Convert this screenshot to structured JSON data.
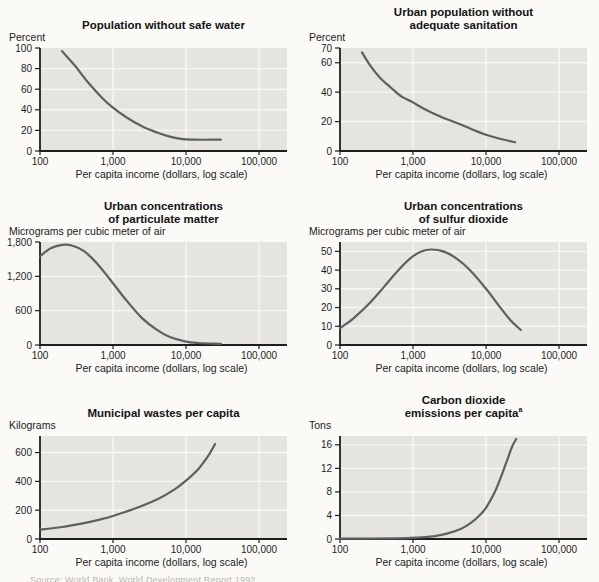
{
  "figure": {
    "x_axis_label": "Per capita income (dollars, log scale)",
    "x_ticks": [
      {
        "value": 100,
        "label": "100"
      },
      {
        "value": 1000,
        "label": "1,000"
      },
      {
        "value": 10000,
        "label": "10,000"
      },
      {
        "value": 100000,
        "label": "100,000"
      }
    ],
    "x_gridlines": [
      1000,
      10000,
      100000
    ],
    "source_note": "Source: World Bank, World Development Report 1992.",
    "colors": {
      "page_bg": "#fbfaf7",
      "plot_bg": "#e5e4e1",
      "grid": "#f7f6f3",
      "curve": "#5f5f5f",
      "axis": "#1e1e1e",
      "text": "#1e1e1e"
    }
  },
  "chart_data": [
    {
      "type": "line",
      "title_line1": "Population without safe water",
      "unit_label": "Percent",
      "xlabel": "Per capita income (dollars, log scale)",
      "x_scale": "log",
      "xlim": [
        100,
        100000
      ],
      "ylim": [
        0,
        100
      ],
      "y_ticks": [
        {
          "value": 0,
          "label": "0"
        },
        {
          "value": 20,
          "label": "20"
        },
        {
          "value": 40,
          "label": "40"
        },
        {
          "value": 60,
          "label": "60"
        },
        {
          "value": 80,
          "label": "80"
        },
        {
          "value": 100,
          "label": "100"
        }
      ],
      "points": [
        [
          200,
          97
        ],
        [
          300,
          83
        ],
        [
          450,
          67
        ],
        [
          700,
          52
        ],
        [
          1000,
          42
        ],
        [
          1500,
          33
        ],
        [
          2500,
          24
        ],
        [
          4000,
          18
        ],
        [
          6000,
          14
        ],
        [
          9000,
          11.5
        ],
        [
          13000,
          11
        ],
        [
          30000,
          11
        ]
      ]
    },
    {
      "type": "line",
      "title_line1": "Urban population without",
      "title_line2": "adequate sanitation",
      "unit_label": "Percent",
      "xlabel": "Per capita income (dollars, log scale)",
      "x_scale": "log",
      "xlim": [
        100,
        100000
      ],
      "ylim": [
        0,
        70
      ],
      "y_ticks": [
        {
          "value": 0,
          "label": "0"
        },
        {
          "value": 20,
          "label": "20"
        },
        {
          "value": 40,
          "label": "40"
        },
        {
          "value": 60,
          "label": "60"
        },
        {
          "value": 70,
          "label": "70"
        }
      ],
      "points": [
        [
          200,
          67
        ],
        [
          260,
          58
        ],
        [
          350,
          50
        ],
        [
          500,
          43
        ],
        [
          700,
          37
        ],
        [
          1000,
          33
        ],
        [
          1500,
          28
        ],
        [
          2500,
          23
        ],
        [
          4000,
          19
        ],
        [
          7000,
          14
        ],
        [
          10000,
          11
        ],
        [
          15000,
          8.5
        ],
        [
          25000,
          6
        ]
      ]
    },
    {
      "type": "line",
      "title_line1": "Urban concentrations",
      "title_line2": "of particulate matter",
      "unit_label": "Micrograms per cubic meter of air",
      "xlabel": "Per capita income (dollars, log scale)",
      "x_scale": "log",
      "xlim": [
        100,
        100000
      ],
      "ylim": [
        0,
        1800
      ],
      "y_ticks": [
        {
          "value": 0,
          "label": "0"
        },
        {
          "value": 600,
          "label": "600"
        },
        {
          "value": 1200,
          "label": "1,200"
        },
        {
          "value": 1800,
          "label": "1,800"
        }
      ],
      "points": [
        [
          100,
          1550
        ],
        [
          140,
          1690
        ],
        [
          200,
          1750
        ],
        [
          280,
          1735
        ],
        [
          400,
          1640
        ],
        [
          600,
          1430
        ],
        [
          1000,
          1080
        ],
        [
          1500,
          790
        ],
        [
          2500,
          470
        ],
        [
          4000,
          265
        ],
        [
          6000,
          140
        ],
        [
          10000,
          60
        ],
        [
          15000,
          35
        ],
        [
          30000,
          20
        ]
      ]
    },
    {
      "type": "line",
      "title_line1": "Urban concentrations",
      "title_line2": "of sulfur dioxide",
      "unit_label": "Micrograms per cubic meter of air",
      "xlabel": "Per capita income (dollars, log scale)",
      "x_scale": "log",
      "xlim": [
        100,
        100000
      ],
      "ylim": [
        0,
        55
      ],
      "y_ticks": [
        {
          "value": 0,
          "label": "0"
        },
        {
          "value": 10,
          "label": "10"
        },
        {
          "value": 20,
          "label": "20"
        },
        {
          "value": 30,
          "label": "30"
        },
        {
          "value": 40,
          "label": "40"
        },
        {
          "value": 50,
          "label": "50"
        }
      ],
      "points": [
        [
          100,
          9
        ],
        [
          150,
          14
        ],
        [
          250,
          22
        ],
        [
          400,
          31
        ],
        [
          600,
          39
        ],
        [
          900,
          46
        ],
        [
          1300,
          50
        ],
        [
          1800,
          51
        ],
        [
          2600,
          50
        ],
        [
          4000,
          46
        ],
        [
          6000,
          40
        ],
        [
          10000,
          30
        ],
        [
          15000,
          21
        ],
        [
          22000,
          13
        ],
        [
          30000,
          8
        ]
      ]
    },
    {
      "type": "line",
      "title_line1": "Municipal wastes per capita",
      "unit_label": "Kilograms",
      "xlabel": "Per capita income (dollars, log scale)",
      "x_scale": "log",
      "xlim": [
        100,
        100000
      ],
      "ylim": [
        0,
        715
      ],
      "y_ticks": [
        {
          "value": 0,
          "label": "0"
        },
        {
          "value": 200,
          "label": "200"
        },
        {
          "value": 400,
          "label": "400"
        },
        {
          "value": 600,
          "label": "600"
        }
      ],
      "points": [
        [
          100,
          65
        ],
        [
          200,
          83
        ],
        [
          400,
          110
        ],
        [
          700,
          138
        ],
        [
          1000,
          160
        ],
        [
          2000,
          212
        ],
        [
          4000,
          275
        ],
        [
          7000,
          345
        ],
        [
          10000,
          405
        ],
        [
          15000,
          490
        ],
        [
          20000,
          575
        ],
        [
          25000,
          660
        ]
      ]
    },
    {
      "type": "line",
      "title_line1": "Carbon dioxide",
      "title_line2": "emissions per capita",
      "title_note": "a",
      "unit_label": "Tons",
      "xlabel": "Per capita income (dollars, log scale)",
      "x_scale": "log",
      "xlim": [
        100,
        100000
      ],
      "ylim": [
        0,
        17.5
      ],
      "y_ticks": [
        {
          "value": 0,
          "label": "0"
        },
        {
          "value": 4,
          "label": "4"
        },
        {
          "value": 8,
          "label": "8"
        },
        {
          "value": 12,
          "label": "12"
        },
        {
          "value": 16,
          "label": "16"
        }
      ],
      "points": [
        [
          100,
          0.05
        ],
        [
          600,
          0.1
        ],
        [
          1200,
          0.25
        ],
        [
          2000,
          0.5
        ],
        [
          3000,
          0.95
        ],
        [
          4500,
          1.7
        ],
        [
          6000,
          2.6
        ],
        [
          8000,
          3.9
        ],
        [
          10000,
          5.3
        ],
        [
          13000,
          7.8
        ],
        [
          16000,
          10.5
        ],
        [
          20000,
          13.8
        ],
        [
          23000,
          15.8
        ],
        [
          26000,
          17
        ]
      ]
    }
  ]
}
